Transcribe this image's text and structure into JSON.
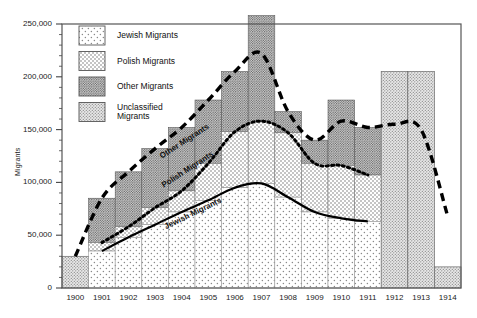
{
  "chart_data": {
    "type": "bar",
    "title": "",
    "xlabel": "",
    "ylabel": "Migrants",
    "ylim": [
      0,
      260000
    ],
    "ytick_labels": [
      "0",
      "50,000",
      "100,000",
      "150,000",
      "200,000",
      "250,000"
    ],
    "ytick_values": [
      0,
      50000,
      100000,
      150000,
      200000,
      250000
    ],
    "minor_tick_interval": 10000,
    "grid": false,
    "legend_position": "top-left-inside",
    "categories": [
      "1900",
      "1901",
      "1902",
      "1903",
      "1904",
      "1905",
      "1906",
      "1907",
      "1908",
      "1909",
      "1910",
      "1911",
      "1912",
      "1913",
      "1914"
    ],
    "series": [
      {
        "name": "Jewish Migrants",
        "pattern": "sparse-dots",
        "values": [
          0,
          35000,
          48000,
          60000,
          72000,
          83000,
          95000,
          99000,
          86000,
          72000,
          66000,
          63000,
          0,
          0,
          0
        ]
      },
      {
        "name": "Polish Migrants",
        "pattern": "medium-dots",
        "values": [
          0,
          43000,
          58000,
          76000,
          92000,
          118000,
          148000,
          158000,
          147000,
          118000,
          116000,
          107000,
          0,
          0,
          0
        ]
      },
      {
        "name": "Other Migrants",
        "pattern": "dark-dots",
        "values": [
          0,
          85000,
          110000,
          132000,
          152000,
          178000,
          205000,
          258000,
          167000,
          140000,
          178000,
          152000,
          0,
          0,
          0
        ]
      },
      {
        "name": "Unclassified Migrants",
        "pattern": "grey-dots",
        "values": [
          30000,
          0,
          0,
          0,
          0,
          0,
          0,
          0,
          0,
          0,
          0,
          0,
          205000,
          205000,
          20000
        ]
      }
    ],
    "curves": [
      {
        "name": "Other Migrants",
        "style": "dashed",
        "label_x": 1903.1,
        "label_y": 128000,
        "points": [
          [
            1900,
            30000
          ],
          [
            1901,
            85000
          ],
          [
            1902,
            110000
          ],
          [
            1903,
            132000
          ],
          [
            1904,
            152000
          ],
          [
            1905,
            178000
          ],
          [
            1906,
            205000
          ],
          [
            1907,
            222000
          ],
          [
            1908,
            167000
          ],
          [
            1909,
            140000
          ],
          [
            1910,
            158000
          ],
          [
            1911,
            152000
          ],
          [
            1912,
            155000
          ],
          [
            1913,
            150000
          ],
          [
            1914,
            68000
          ]
        ]
      },
      {
        "name": "Polish Migrants",
        "style": "dotted",
        "label_x": 1903.2,
        "label_y": 100000,
        "points": [
          [
            1901,
            43000
          ],
          [
            1902,
            58000
          ],
          [
            1903,
            76000
          ],
          [
            1904,
            92000
          ],
          [
            1905,
            118000
          ],
          [
            1906,
            148000
          ],
          [
            1907,
            158000
          ],
          [
            1908,
            147000
          ],
          [
            1909,
            118000
          ],
          [
            1910,
            116000
          ],
          [
            1911,
            107000
          ]
        ]
      },
      {
        "name": "Jewish Migrants",
        "style": "solid",
        "label_x": 1903.3,
        "label_y": 62000,
        "points": [
          [
            1901,
            35000
          ],
          [
            1902,
            48000
          ],
          [
            1903,
            60000
          ],
          [
            1904,
            72000
          ],
          [
            1905,
            83000
          ],
          [
            1906,
            95000
          ],
          [
            1907,
            99000
          ],
          [
            1908,
            86000
          ],
          [
            1909,
            72000
          ],
          [
            1910,
            66000
          ],
          [
            1911,
            63000
          ]
        ]
      }
    ],
    "legend_entries": [
      {
        "label": "Jewish Migrants",
        "pattern": "sparse-dots"
      },
      {
        "label": "Polish Migrants",
        "pattern": "medium-dots"
      },
      {
        "label": "Other Migrants",
        "pattern": "dark-dots"
      },
      {
        "label": "Unclassified\nMigrants",
        "pattern": "grey-dots"
      }
    ],
    "colors": {
      "axis": "#444444",
      "text": "#111111",
      "sparse_dots": "#8a8a8a",
      "medium_dots": "#707070",
      "dark_dots": "#5a5a5a",
      "grey_dots": "#8d8d8d",
      "curve": "#000000"
    }
  }
}
